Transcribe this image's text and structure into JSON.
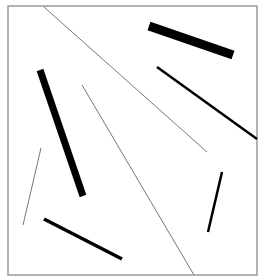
{
  "canvas": {
    "width": 265,
    "height": 280,
    "background": "#ffffff"
  },
  "frame": {
    "x": 8,
    "y": 6,
    "width": 249,
    "height": 269,
    "stroke": "#9a9a9a",
    "stroke_width": 1.5
  },
  "segments": [
    {
      "id": "long-diagonal",
      "x1": 44,
      "y1": 7,
      "x2": 207,
      "y2": 152,
      "stroke": "#777777",
      "width": 1
    },
    {
      "id": "thick-bar-top-right",
      "x1": 149,
      "y1": 26,
      "x2": 233,
      "y2": 55,
      "stroke": "#000000",
      "width": 9
    },
    {
      "id": "medium-line-right",
      "x1": 157,
      "y1": 67,
      "x2": 257,
      "y2": 139,
      "stroke": "#000000",
      "width": 2.5
    },
    {
      "id": "thick-bar-left",
      "x1": 40,
      "y1": 70,
      "x2": 83,
      "y2": 196,
      "stroke": "#000000",
      "width": 7
    },
    {
      "id": "thin-line-center",
      "x1": 82,
      "y1": 85,
      "x2": 194,
      "y2": 275,
      "stroke": "#777777",
      "width": 1
    },
    {
      "id": "thin-line-left",
      "x1": 41,
      "y1": 148,
      "x2": 23,
      "y2": 225,
      "stroke": "#777777",
      "width": 1
    },
    {
      "id": "short-line-right",
      "x1": 222,
      "y1": 172,
      "x2": 208,
      "y2": 232,
      "stroke": "#000000",
      "width": 2.5
    },
    {
      "id": "line-bottom-left",
      "x1": 44,
      "y1": 219,
      "x2": 122,
      "y2": 259,
      "stroke": "#000000",
      "width": 3.5
    }
  ]
}
